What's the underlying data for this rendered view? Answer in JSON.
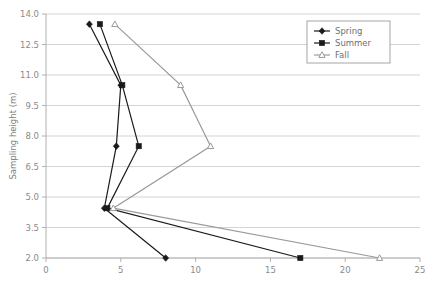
{
  "chart_data": {
    "type": "line",
    "title": "",
    "subtitle": "",
    "xlabel": "",
    "ylabel": "Sampling height (m)",
    "xlim": [
      0,
      25
    ],
    "ylim": [
      2.0,
      14.0
    ],
    "xticks": [
      0,
      5,
      10,
      15,
      20,
      25
    ],
    "xtick_labels": [
      "0",
      "5",
      "10",
      "15",
      "20",
      "25"
    ],
    "yticks": [
      2.0,
      3.5,
      5.0,
      6.5,
      8.0,
      9.5,
      11.0,
      12.5,
      14.0
    ],
    "ytick_labels": [
      "2.0",
      "3.5",
      "5.0",
      "6.5",
      "8.0",
      "9.5",
      "11.0",
      "12.5",
      "14.0"
    ],
    "grid": "horizontal",
    "orientation": "x-value-vs-y-height",
    "legend_position": "top-right",
    "legend_entries": [
      "Spring",
      "Summer",
      "Fall"
    ],
    "series": [
      {
        "name": "Spring",
        "color": "#1a1a1a",
        "marker": "diamond",
        "points": [
          {
            "x": 8.0,
            "y": 2.0
          },
          {
            "x": 3.9,
            "y": 4.45
          },
          {
            "x": 4.7,
            "y": 7.5
          },
          {
            "x": 5.0,
            "y": 10.5
          },
          {
            "x": 2.9,
            "y": 13.5
          }
        ]
      },
      {
        "name": "Summer",
        "color": "#1a1a1a",
        "marker": "square",
        "points": [
          {
            "x": 17.0,
            "y": 2.0
          },
          {
            "x": 4.1,
            "y": 4.45
          },
          {
            "x": 6.2,
            "y": 7.5
          },
          {
            "x": 5.1,
            "y": 10.5
          },
          {
            "x": 3.6,
            "y": 13.5
          }
        ]
      },
      {
        "name": "Fall",
        "color": "#9a9a9a",
        "marker": "triangle",
        "points": [
          {
            "x": 22.3,
            "y": 2.0
          },
          {
            "x": 4.5,
            "y": 4.45
          },
          {
            "x": 11.0,
            "y": 7.5
          },
          {
            "x": 9.0,
            "y": 10.5
          },
          {
            "x": 4.6,
            "y": 13.5
          }
        ]
      }
    ]
  },
  "colors": {
    "dark_series": "#1a1a1a",
    "light_series": "#9a9a9a",
    "grid": "#c9c9c9",
    "axis": "#b0b0b0",
    "tick_text": "#8a8a8a",
    "legend_border": "#9b9b9b",
    "background": "#ffffff"
  }
}
